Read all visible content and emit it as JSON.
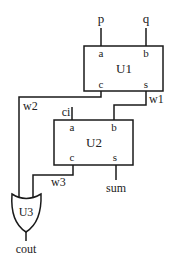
{
  "diagram": {
    "type": "circuit-schematic",
    "inputs": [
      {
        "name": "p"
      },
      {
        "name": "q"
      },
      {
        "name": "ci"
      }
    ],
    "outputs": [
      {
        "name": "sum"
      },
      {
        "name": "cout"
      }
    ],
    "components": {
      "U1": {
        "label": "U1",
        "kind": "half-adder",
        "ports": {
          "a": "a",
          "b": "b",
          "c": "c",
          "s": "s"
        }
      },
      "U2": {
        "label": "U2",
        "kind": "half-adder",
        "ports": {
          "a": "a",
          "b": "b",
          "c": "c",
          "s": "s"
        }
      },
      "U3": {
        "label": "U3",
        "kind": "or-gate"
      }
    },
    "wires": [
      {
        "label": "w1",
        "from": "U1.s",
        "to": "U2.b"
      },
      {
        "label": "w2",
        "from": "U1.c",
        "to": "U3.in1"
      },
      {
        "label": "w3",
        "from": "U2.c",
        "to": "U3.in2"
      }
    ],
    "connections": [
      {
        "from": "p",
        "to": "U1.a"
      },
      {
        "from": "q",
        "to": "U1.b"
      },
      {
        "from": "ci",
        "to": "U2.a"
      },
      {
        "from": "U2.s",
        "to": "sum"
      },
      {
        "from": "U3.out",
        "to": "cout"
      }
    ]
  }
}
